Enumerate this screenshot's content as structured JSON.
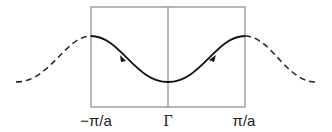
{
  "diagram": {
    "labels": {
      "left": "−π/a",
      "center": "Γ",
      "right": "π/a"
    },
    "colors": {
      "box": "#888888",
      "curve": "#111111",
      "dashed": "#222222"
    }
  }
}
